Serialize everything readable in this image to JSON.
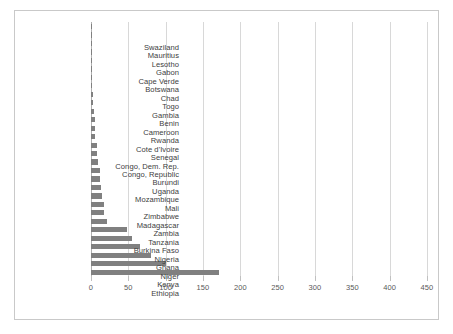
{
  "figure": {
    "title": "",
    "background": "#ffffff",
    "frame_color": "#c9c9c9",
    "bar_color": "#808080",
    "grid_color": "#d8d8d8",
    "axis_color": "#b0b0b0",
    "label_color": "#404040",
    "tick_label_color": "#595959"
  },
  "chart_data": {
    "type": "bar",
    "orientation": "horizontal",
    "title": "",
    "subtitle": "",
    "xlabel": "",
    "ylabel": "",
    "xlim": [
      0,
      450
    ],
    "ylim": null,
    "grid": true,
    "grid_axis": "x",
    "legend": false,
    "legend_position": "none",
    "xticks": [
      0,
      50,
      100,
      150,
      200,
      250,
      300,
      350,
      400,
      450
    ],
    "xtick_labels": [
      "0",
      "50",
      "100",
      "150",
      "200",
      "250",
      "300",
      "350",
      "400",
      "450"
    ],
    "annotations": [],
    "categories": [
      "Swaziland",
      "Mauritius",
      "Lesotho",
      "Gabon",
      "Cape Verde",
      "Botswana",
      "Chad",
      "Togo",
      "Gambia",
      "Benin",
      "Cameroon",
      "Rwanda",
      "Cote d'Ivoire",
      "Senegal",
      "Congo, Dem. Rep.",
      "Congo, Republic",
      "Burundi",
      "Uganda",
      "Mozambique",
      "Mali",
      "Zimbabwe",
      "Madagascar",
      "Zambia",
      "Tanzania",
      "Burkina Faso",
      "Nigeria",
      "Ghana",
      "Niger",
      "Kenya",
      "Ethiopia"
    ],
    "values": [
      1,
      1,
      1,
      1,
      1,
      1,
      2,
      2,
      3,
      3,
      4,
      5,
      5,
      6,
      8,
      8,
      10,
      12,
      12,
      13,
      15,
      18,
      18,
      22,
      48,
      55,
      66,
      80,
      100,
      172
    ]
  }
}
